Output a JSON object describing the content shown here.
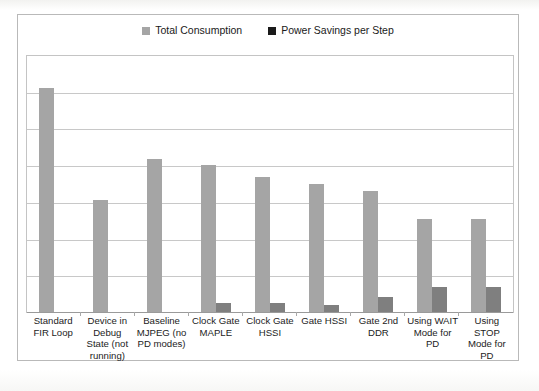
{
  "chart_data": {
    "type": "bar",
    "title": "",
    "subtitle": "",
    "xlabel": "",
    "ylabel": "",
    "grid": true,
    "legend_position": "top-center",
    "ylim": [
      0,
      7
    ],
    "y_tick_count": 7,
    "y_tick_labels_visible": false,
    "categories": [
      "Standard FIR Loop",
      "Device in Debug State (not running)",
      "Baseline MJPEG (no PD modes)",
      "Clock Gate MAPLE",
      "Clock Gate HSSI",
      "Gate HSSI",
      "Gate 2nd DDR",
      "Using WAIT Mode for PD",
      "Using STOP Mode for PD"
    ],
    "series": [
      {
        "name": "Total Consumption",
        "color": "#a5a5a5",
        "values": [
          6.13,
          3.05,
          4.19,
          4.03,
          3.7,
          3.51,
          3.32,
          2.53,
          2.53
        ]
      },
      {
        "name": "Power Savings per Step",
        "color": "#7f7f7f",
        "values": [
          0,
          0,
          0,
          0.25,
          0.25,
          0.18,
          0.42,
          0.68,
          0.68
        ]
      }
    ]
  },
  "legend": {
    "entries": [
      {
        "label": "Total Consumption",
        "color": "#a5a5a5",
        "marker": "square-marker"
      },
      {
        "label": "Power Savings per Step",
        "color": "#1a1a1a",
        "marker": "square-marker"
      }
    ]
  },
  "axis": {
    "category_labels": [
      "Standard FIR Loop",
      "Device in Debug State (not running)",
      "Baseline MJPEG (no PD modes)",
      "Clock Gate MAPLE",
      "Clock Gate HSSI",
      "Gate HSSI",
      "Gate 2nd DDR",
      "Using WAIT Mode for PD",
      "Using STOP Mode for PD"
    ]
  },
  "colors": {
    "series_a": "#a5a5a5",
    "series_b": "#7f7f7f",
    "legend_b_marker": "#1a1a1a",
    "grid": "#c8c8c8",
    "frame": "#b9b9b9",
    "plot_frame": "#c4c4c4",
    "axis": "#9a9a9a",
    "text": "#1c1c1c",
    "background": "#ffffff"
  }
}
